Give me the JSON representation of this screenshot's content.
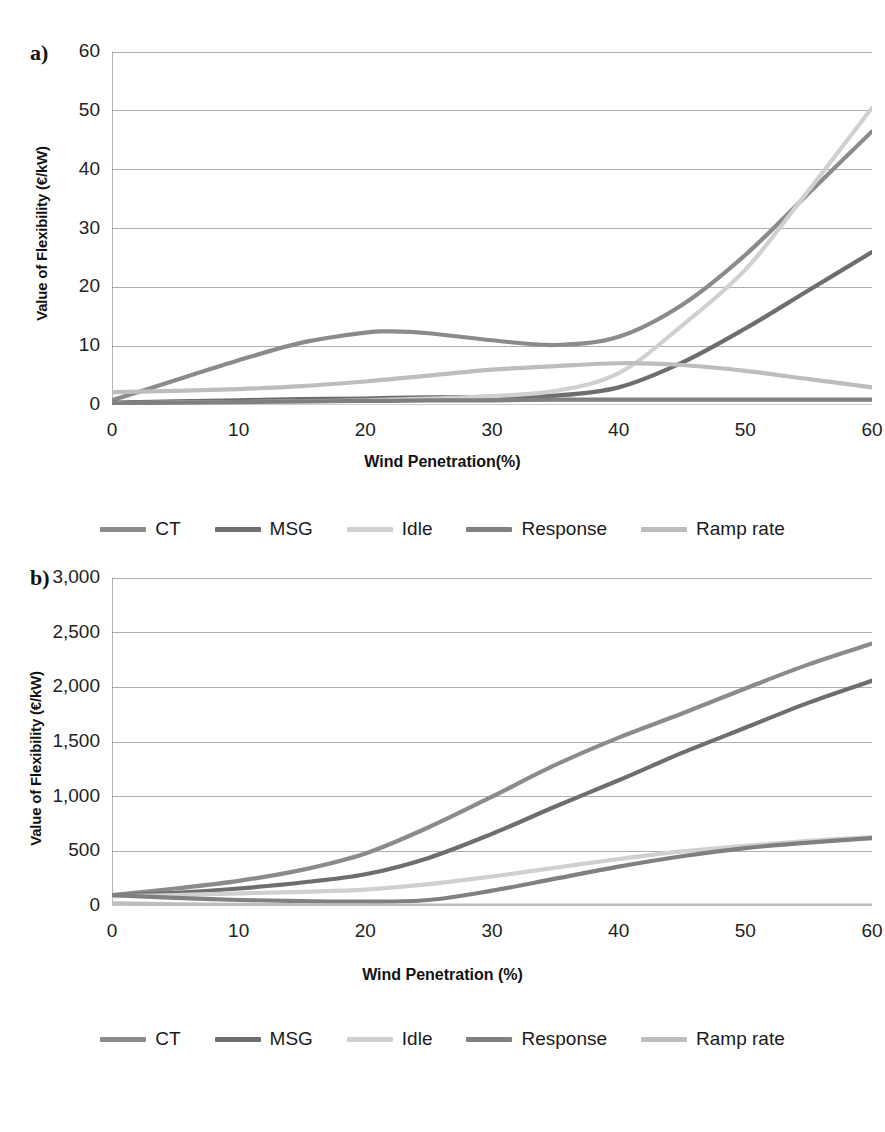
{
  "figure": {
    "panel_a_tag": "a)",
    "panel_b_tag": "b)"
  },
  "legend": {
    "items": [
      {
        "label": "CT",
        "color": "#8b8b8b"
      },
      {
        "label": "MSG",
        "color": "#6e6e6e"
      },
      {
        "label": "Idle",
        "color": "#d0d0d0"
      },
      {
        "label": "Response",
        "color": "#808080"
      },
      {
        "label": "Ramp rate",
        "color": "#bdbdbd"
      }
    ]
  },
  "chart_data": [
    {
      "type": "line",
      "panel": "a)",
      "title": "",
      "xlabel": "Wind Penetration(%)",
      "ylabel": "Value of Flexibility (€/kW)",
      "xlim": [
        0,
        60
      ],
      "ylim": [
        0,
        60
      ],
      "xticks": [
        0,
        10,
        20,
        30,
        40,
        50,
        60
      ],
      "yticks": [
        0,
        10,
        20,
        30,
        40,
        50,
        60
      ],
      "xtick_labels": [
        "0",
        "10",
        "20",
        "30",
        "40",
        "50",
        "60"
      ],
      "ytick_labels": [
        "0",
        "10",
        "20",
        "30",
        "40",
        "50",
        "60"
      ],
      "grid": true,
      "legend_position": "below",
      "x": [
        0,
        5,
        10,
        15,
        20,
        22,
        25,
        30,
        35,
        40,
        45,
        50,
        55,
        60
      ],
      "series": [
        {
          "name": "CT",
          "color": "#8b8b8b",
          "values": [
            0.8,
            4.2,
            7.6,
            10.6,
            12.3,
            12.5,
            12.2,
            11.0,
            10.2,
            11.6,
            17.0,
            25.5,
            36.0,
            46.5
          ]
        },
        {
          "name": "MSG",
          "color": "#6e6e6e",
          "values": [
            0.4,
            0.6,
            0.8,
            1.0,
            1.1,
            1.2,
            1.3,
            1.4,
            1.6,
            3.0,
            7.2,
            13.0,
            19.5,
            26.0
          ]
        },
        {
          "name": "Idle",
          "color": "#d0d0d0",
          "values": [
            0.3,
            0.4,
            0.5,
            0.6,
            0.8,
            0.9,
            1.1,
            1.5,
            2.4,
            5.4,
            13.5,
            23.0,
            36.5,
            50.5
          ]
        },
        {
          "name": "Response",
          "color": "#808080",
          "values": [
            0.3,
            0.4,
            0.5,
            0.6,
            0.7,
            0.7,
            0.8,
            0.8,
            0.9,
            0.9,
            0.9,
            0.9,
            0.9,
            0.9
          ]
        },
        {
          "name": "Ramp rate",
          "color": "#bdbdbd",
          "values": [
            2.2,
            2.4,
            2.7,
            3.2,
            4.0,
            4.4,
            5.0,
            6.0,
            6.6,
            7.1,
            6.8,
            5.8,
            4.4,
            3.0
          ]
        }
      ]
    },
    {
      "type": "line",
      "panel": "b)",
      "title": "",
      "xlabel": "Wind Penetration (%)",
      "ylabel": "Value of Flexibility (€/kW)",
      "xlim": [
        0,
        60
      ],
      "ylim": [
        0,
        3000
      ],
      "xticks": [
        0,
        10,
        20,
        30,
        40,
        50,
        60
      ],
      "yticks": [
        0,
        500,
        1000,
        1500,
        2000,
        2500,
        3000
      ],
      "xtick_labels": [
        "0",
        "10",
        "20",
        "30",
        "40",
        "50",
        "60"
      ],
      "ytick_labels": [
        "0",
        "500",
        "1,000",
        "1,500",
        "2,000",
        "2,500",
        "3,000"
      ],
      "grid": true,
      "legend_position": "below",
      "x": [
        0,
        5,
        10,
        15,
        20,
        25,
        30,
        35,
        40,
        45,
        50,
        55,
        60
      ],
      "series": [
        {
          "name": "CT",
          "color": "#8b8b8b",
          "values": [
            100,
            160,
            230,
            330,
            480,
            720,
            1000,
            1290,
            1540,
            1760,
            1990,
            2210,
            2400
          ]
        },
        {
          "name": "MSG",
          "color": "#6e6e6e",
          "values": [
            95,
            120,
            160,
            215,
            290,
            440,
            660,
            910,
            1150,
            1400,
            1630,
            1860,
            2060
          ]
        },
        {
          "name": "Idle",
          "color": "#d0d0d0",
          "values": [
            90,
            100,
            115,
            130,
            150,
            200,
            270,
            350,
            430,
            500,
            550,
            595,
            630
          ]
        },
        {
          "name": "Response",
          "color": "#808080",
          "values": [
            100,
            75,
            55,
            45,
            40,
            55,
            140,
            250,
            360,
            455,
            530,
            580,
            620
          ]
        },
        {
          "name": "Ramp rate",
          "color": "#bdbdbd",
          "values": [
            25,
            16,
            10,
            7,
            5,
            4,
            3,
            3,
            3,
            3,
            3,
            3,
            3
          ]
        }
      ]
    }
  ]
}
